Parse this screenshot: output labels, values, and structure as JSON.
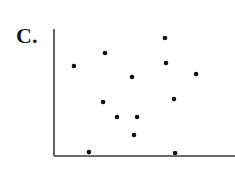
{
  "panel": {
    "label": "C."
  },
  "style": {
    "axis_color": "#3a3a3a",
    "point_color": "#111111",
    "background": "#ffffff"
  },
  "plot_area": {
    "origin_px": [
      54,
      156
    ],
    "x_end_px": 235,
    "y_top_px": 29
  },
  "chart_data": {
    "type": "scatter",
    "title": "C.",
    "xlabel": "",
    "ylabel": "",
    "xlim": [
      0,
      100
    ],
    "ylim": [
      0,
      100
    ],
    "grid": false,
    "legend": null,
    "ticks": false,
    "series": [
      {
        "name": "points",
        "points": [
          {
            "x": 11.0,
            "y": 70.9
          },
          {
            "x": 28.2,
            "y": 81.1
          },
          {
            "x": 61.3,
            "y": 92.9
          },
          {
            "x": 61.9,
            "y": 73.2
          },
          {
            "x": 43.1,
            "y": 62.2
          },
          {
            "x": 78.5,
            "y": 64.6
          },
          {
            "x": 27.1,
            "y": 42.5
          },
          {
            "x": 66.3,
            "y": 44.9
          },
          {
            "x": 34.8,
            "y": 30.7
          },
          {
            "x": 45.9,
            "y": 30.7
          },
          {
            "x": 44.2,
            "y": 16.5
          },
          {
            "x": 19.3,
            "y": 3.1
          },
          {
            "x": 66.9,
            "y": 2.4
          }
        ]
      }
    ]
  }
}
